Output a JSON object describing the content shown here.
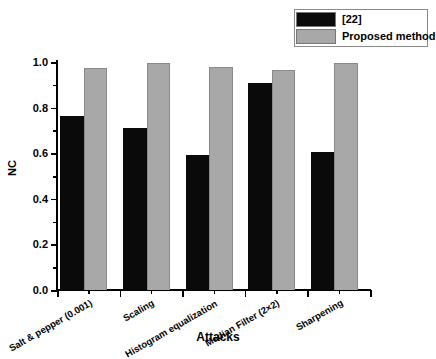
{
  "chart_data": {
    "type": "bar",
    "title": "",
    "xlabel": "Attacks",
    "ylabel": "NC",
    "ylim": [
      0.0,
      1.0
    ],
    "ytick_labels": [
      "0.0",
      "0.2",
      "0.4",
      "0.6",
      "0.8",
      "1.0"
    ],
    "ytick_values": [
      0.0,
      0.2,
      0.4,
      0.6,
      0.8,
      1.0
    ],
    "minor_ticks": true,
    "grid": false,
    "legend_position": "top-right",
    "categories": [
      "Salt & pepper (0.001)",
      "Scaling",
      "Histogram equalization",
      "Median Filter (2×2)",
      "Sharpening"
    ],
    "series": [
      {
        "name": "[22]",
        "color": "#0a0a0a",
        "values": [
          0.765,
          0.71,
          0.59,
          0.91,
          0.605
        ]
      },
      {
        "name": "Proposed method",
        "color": "#a8a8a8",
        "values": [
          0.975,
          0.995,
          0.978,
          0.965,
          0.995
        ]
      }
    ]
  },
  "legend": {
    "items": [
      {
        "label": "[22]",
        "color": "#0a0a0a"
      },
      {
        "label": "Proposed method",
        "color": "#a8a8a8"
      }
    ]
  },
  "axes": {
    "y_title": "NC",
    "x_title": "Attacks"
  }
}
